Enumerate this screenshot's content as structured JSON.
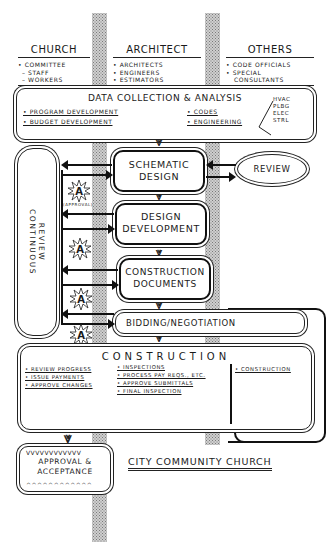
{
  "columns": [
    {
      "title": "CHURCH",
      "items": [
        "• COMMITTEE",
        "– STAFF",
        "– WORKERS"
      ]
    },
    {
      "title": "ARCHITECT",
      "items": [
        "• ARCHITECTS",
        "• ENGINEERS",
        "• ESTIMATORS"
      ]
    },
    {
      "title": "OTHERS",
      "items": [
        "• CODE OFFICIALS",
        "• SPECIAL",
        "CONSULTANTS"
      ]
    }
  ],
  "data_collection": {
    "title": "DATA COLLECTION & ANALYSIS",
    "left_items": [
      "• PROGRAM DEVELOPMENT",
      "• BUDGET DEVELOPMENT"
    ],
    "right_items": [
      "• CODES",
      "• ENGINEERING"
    ],
    "engineering_branches": [
      "HVAC",
      "PLBG",
      "ELEC",
      "STRL"
    ]
  },
  "continuous_review": {
    "line1": "CONTINUOUS",
    "line2": "REVIEW"
  },
  "phases": {
    "schematic": {
      "line1": "SCHEMATIC",
      "line2": "DESIGN"
    },
    "design_development": {
      "line1": "DESIGN",
      "line2": "DEVELOPMENT"
    },
    "construction_documents": {
      "line1": "CONSTRUCTION",
      "line2": "DOCUMENTS"
    },
    "bidding": {
      "label": "BIDDING/NEGOTIATION"
    }
  },
  "review": {
    "label": "REVIEW"
  },
  "approval": {
    "marker": "A",
    "caption": "(APPROVAL)"
  },
  "contractor": {
    "label": "• CONTRACTOR"
  },
  "construction": {
    "title": "CONSTRUCTION",
    "church_items": [
      "• REVIEW PROGRESS",
      "• ISSUE PAYMENTS",
      "• APPROVE CHANGES"
    ],
    "architect_items": [
      "• INSPECTIONS",
      "• PROCESS PAY REQS., ETC.",
      "• APPROVE SUBMITTALS",
      "• FINAL INSPECTION"
    ],
    "contractor_items": [
      "• CONSTRUCTION"
    ]
  },
  "final": {
    "line1": "APPROVAL &",
    "line2": "ACCEPTANCE"
  },
  "project_name": "CITY COMMUNITY CHURCH"
}
